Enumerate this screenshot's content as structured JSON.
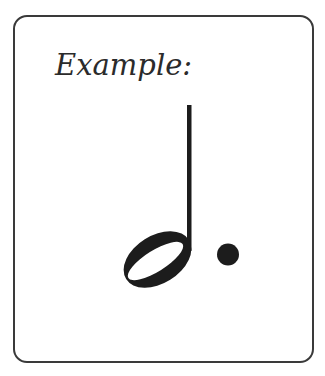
{
  "card": {
    "title": "Example:"
  },
  "figure": {
    "symbol": "dotted-half-note",
    "colors": {
      "ink": "#1c1c1c",
      "border": "#3a3a3a",
      "background": "#ffffff"
    }
  }
}
